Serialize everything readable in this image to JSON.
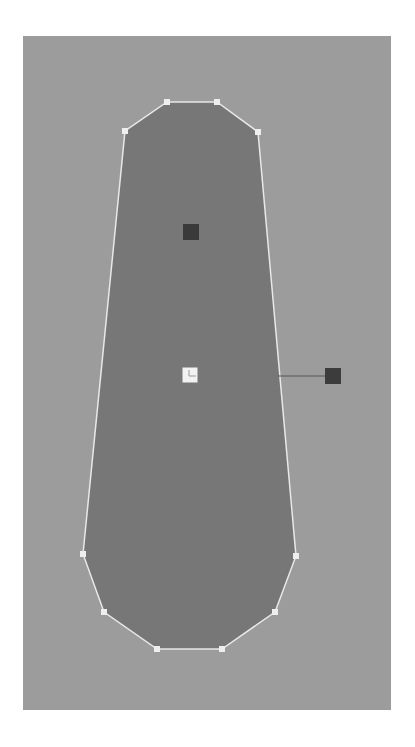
{
  "canvas": {
    "background": "#9c9c9c",
    "x": 23,
    "y": 36,
    "width": 368,
    "height": 674
  },
  "shape": {
    "fill": "#777777",
    "stroke": "#e8e8e8",
    "vertices": [
      [
        167,
        102
      ],
      [
        217,
        102
      ],
      [
        258,
        132
      ],
      [
        296,
        556
      ],
      [
        275,
        612
      ],
      [
        222,
        649
      ],
      [
        157,
        649
      ],
      [
        104,
        612
      ],
      [
        83,
        554
      ],
      [
        125,
        131
      ]
    ],
    "vertex_handle_color": "#eeeeee",
    "vertex_handle_size": 6
  },
  "handles": {
    "upper": {
      "x": 191,
      "y": 232,
      "size": 16,
      "color": "#3a3a3a"
    },
    "center": {
      "x": 190,
      "y": 375,
      "size": 15,
      "color": "#f2f2f2",
      "mark_color": "#999999"
    },
    "right": {
      "x": 333,
      "y": 376,
      "size": 16,
      "color": "#3c3c3c"
    },
    "connector": {
      "x1": 278,
      "y1": 376,
      "x2": 325,
      "y2": 376,
      "color": "#555555"
    }
  },
  "labels": {
    "shape": "Polygon shape",
    "upper_handle": "Upper control handle",
    "center_handle": "Center pivot handle",
    "right_handle": "Rotation handle"
  }
}
